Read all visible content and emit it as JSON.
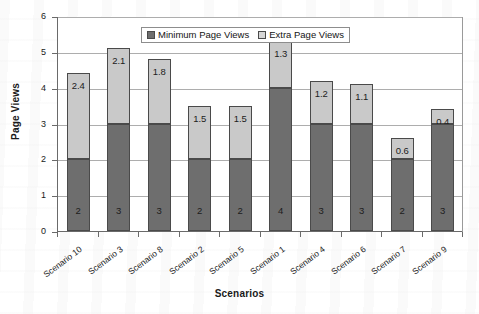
{
  "chart_data": {
    "type": "bar",
    "subtype": "stacked-vertical",
    "title": "",
    "xlabel": "Scenarios",
    "ylabel": "Page Views",
    "ylim": [
      0,
      6
    ],
    "yticks": [
      0,
      1,
      2,
      3,
      4,
      5,
      6
    ],
    "ytick_labels": [
      "0",
      "1",
      "2",
      "3",
      "4",
      "5",
      "6"
    ],
    "grid": true,
    "grid_axis": "y",
    "legend_position": "top-center",
    "categories": [
      "Scenario 10",
      "Scenario 3",
      "Scenario 8",
      "Scenario 2",
      "Scenario 5",
      "Scenario 1",
      "Scenario 4",
      "Scenario 6",
      "Scenario 7",
      "Scenario 9"
    ],
    "series": [
      {
        "name": "Minimum Page Views",
        "color": "#6e6e6e",
        "values": [
          2,
          3,
          3,
          2,
          2,
          4,
          3,
          3,
          2,
          3
        ],
        "labels": [
          "2",
          "3",
          "3",
          "2",
          "2",
          "4",
          "3",
          "3",
          "2",
          "3"
        ]
      },
      {
        "name": "Extra Page Views",
        "color": "#c9c9c9",
        "values": [
          2.4,
          2.1,
          1.8,
          1.5,
          1.5,
          1.3,
          1.2,
          1.1,
          0.6,
          0.4
        ],
        "labels": [
          "2.4",
          "2.1",
          "1.8",
          "1.5",
          "1.5",
          "1.3",
          "1.2",
          "1.1",
          "0.6",
          "0.4"
        ]
      }
    ],
    "totals": [
      4.4,
      5.1,
      4.8,
      3.5,
      3.5,
      5.3,
      4.2,
      4.1,
      2.6,
      3.4
    ]
  },
  "legend": {
    "items": [
      {
        "label": "Minimum Page Views"
      },
      {
        "label": "Extra Page Views"
      }
    ]
  },
  "axis": {
    "y_title": "Page Views",
    "x_title": "Scenarios"
  }
}
